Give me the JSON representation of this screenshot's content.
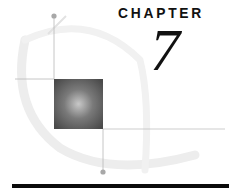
{
  "heading": {
    "label": "CHAPTER",
    "number": "7"
  },
  "decoration": {
    "icon": "chapter-emblem",
    "square_color": "#5a5a5a",
    "line_color": "#b8b8b8",
    "arc_color": "#ececec"
  }
}
